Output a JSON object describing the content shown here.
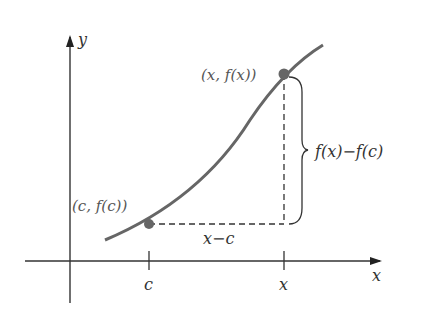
{
  "diagram": {
    "axes": {
      "x_label": "x",
      "y_label": "y"
    },
    "ticks": {
      "c_label": "c",
      "x_label": "x"
    },
    "points": {
      "left": {
        "label": "(c, f(c))"
      },
      "right": {
        "label": "(x, f(x))"
      }
    },
    "horizontal_segment_label": "x−c",
    "vertical_brace_label": "f(x)−f(c)",
    "colors": {
      "curve": "#666666",
      "point": "#666666",
      "axis": "#333333",
      "dash": "#333333"
    }
  }
}
